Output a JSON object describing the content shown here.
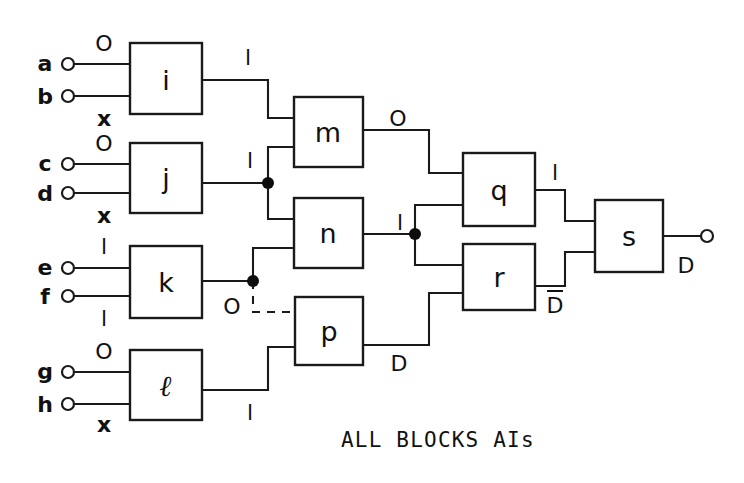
{
  "figure": {
    "type": "logic-block-diagram",
    "caption": "ALL BLOCKS AIs",
    "background_color": "#ffffff",
    "line_color": "#1a1a1a"
  },
  "inputs": [
    {
      "id": "a",
      "label": "a",
      "state": "O",
      "state_position": "above"
    },
    {
      "id": "b",
      "label": "b",
      "state": "x",
      "state_position": "below"
    },
    {
      "id": "c",
      "label": "c",
      "state": "O",
      "state_position": "above"
    },
    {
      "id": "d",
      "label": "d",
      "state": "x",
      "state_position": "below"
    },
    {
      "id": "e",
      "label": "e",
      "state": "l",
      "state_position": "above"
    },
    {
      "id": "f",
      "label": "f",
      "state": "l",
      "state_position": "below"
    },
    {
      "id": "g",
      "label": "g",
      "state": "O",
      "state_position": "above"
    },
    {
      "id": "h",
      "label": "h",
      "state": "x",
      "state_position": "below"
    }
  ],
  "blocks": [
    {
      "id": "i",
      "label": "i",
      "style": "plain"
    },
    {
      "id": "j",
      "label": "j",
      "style": "plain"
    },
    {
      "id": "k",
      "label": "k",
      "style": "plain"
    },
    {
      "id": "l",
      "label": "ℓ",
      "style": "script"
    },
    {
      "id": "m",
      "label": "m",
      "style": "plain"
    },
    {
      "id": "n",
      "label": "n",
      "style": "plain"
    },
    {
      "id": "p",
      "label": "p",
      "style": "plain"
    },
    {
      "id": "q",
      "label": "q",
      "style": "plain"
    },
    {
      "id": "r",
      "label": "r",
      "style": "plain"
    },
    {
      "id": "s",
      "label": "s",
      "style": "plain"
    }
  ],
  "signal_labels": [
    {
      "id": "out-i",
      "text": "l",
      "from": "i",
      "to": "m"
    },
    {
      "id": "out-j",
      "text": "l",
      "from": "j",
      "to": "m,n"
    },
    {
      "id": "out-k",
      "text": "O",
      "from": "k",
      "to": "n,p"
    },
    {
      "id": "out-l",
      "text": "l",
      "from": "l",
      "to": "p"
    },
    {
      "id": "out-m",
      "text": "O",
      "from": "m",
      "to": "q"
    },
    {
      "id": "out-n",
      "text": "l",
      "from": "n",
      "to": "q,r"
    },
    {
      "id": "out-p",
      "text": "D",
      "from": "p",
      "to": "r"
    },
    {
      "id": "out-q",
      "text": "l",
      "from": "q",
      "to": "s"
    },
    {
      "id": "out-r",
      "text": "D̄",
      "from": "r",
      "to": "s",
      "overbar": true
    },
    {
      "id": "out-s",
      "text": "D",
      "from": "s",
      "to": "output-terminal"
    }
  ],
  "output": {
    "id": "out",
    "label": "D"
  },
  "junctions": [
    {
      "id": "junction-j",
      "on": "out-j"
    },
    {
      "id": "junction-k",
      "on": "out-k"
    },
    {
      "id": "junction-n",
      "on": "out-n"
    }
  ],
  "dashed_connection": {
    "from": "junction-k",
    "to": "p",
    "style": "dashed"
  }
}
